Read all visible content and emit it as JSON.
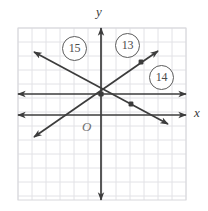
{
  "figure": {
    "type": "coordinate-grid-diagram",
    "axis_labels": {
      "x": "x",
      "y": "y",
      "origin": "O"
    },
    "colors": {
      "grid": "#e2e2e6",
      "grid_major": "#d0d0d4",
      "line": "#3c3c3c",
      "axis": "#3c3c3c",
      "callout_border": "#5c5c5c",
      "callout_text": "#4a4a4a",
      "background": "#ffffff"
    },
    "callouts": [
      {
        "label": "15",
        "x": 73,
        "y": 47
      },
      {
        "label": "13",
        "x": 126,
        "y": 44
      },
      {
        "label": "14",
        "x": 160,
        "y": 76
      }
    ]
  },
  "chart_data": {
    "type": "line",
    "title": "",
    "xlabel": "x",
    "ylabel": "y",
    "grid": true,
    "legend": "none",
    "plot_box": {
      "left": 18,
      "top": 28,
      "right": 186,
      "bottom": 200,
      "cell": 14
    },
    "origin_px": {
      "x": 101,
      "y": 115
    },
    "axes": [
      {
        "name": "y-axis",
        "orientation": "vertical",
        "x_px": 101,
        "from_px": {
          "x": 101,
          "y": 200
        },
        "to_px": {
          "x": 101,
          "y": 28
        },
        "arrows": "both"
      },
      {
        "name": "x-axis",
        "orientation": "horizontal",
        "y_px": 115,
        "from_px": {
          "x": 18,
          "y": 115
        },
        "to_px": {
          "x": 186,
          "y": 115
        },
        "arrows": "both"
      }
    ],
    "series": [
      {
        "name": "horizontal-line",
        "kind": "horizontal-line",
        "arrows": "both",
        "from_px": {
          "x": 18,
          "y": 94
        },
        "to_px": {
          "x": 186,
          "y": 94
        },
        "points_px": []
      },
      {
        "name": "line-13",
        "kind": "line-positive-slope",
        "arrows": "both",
        "from_px": {
          "x": 34,
          "y": 137
        },
        "to_px": {
          "x": 158,
          "y": 51
        },
        "points_px": [
          {
            "x": 141,
            "y": 62
          }
        ]
      },
      {
        "name": "line-15",
        "kind": "line-negative-slope",
        "arrows": "both",
        "from_px": {
          "x": 34,
          "y": 52
        },
        "to_px": {
          "x": 168,
          "y": 124
        },
        "points_px": [
          {
            "x": 131,
            "y": 104
          }
        ]
      }
    ],
    "intersection_px": {
      "x": 101,
      "y": 94
    }
  }
}
